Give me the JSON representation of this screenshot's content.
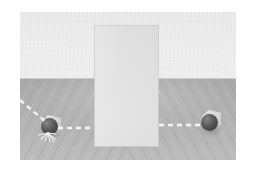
{
  "scene": {
    "title": "Occluded ball trajectory scene",
    "description": "Two dark spheres on a textured gray floor separated by a light rectangular occluder panel, connected by a white dashed trajectory",
    "frame": {
      "x": 20,
      "y": 12,
      "width": 216,
      "height": 148
    },
    "border_color": "#ffffff"
  },
  "background": {
    "label": "back wall",
    "color": "#eeeeee",
    "top_color": "#eaeaea",
    "bottom_color": "#f0f0f0",
    "height": 67
  },
  "horizon": {
    "label": "horizon seam",
    "color": "#c2c2c2",
    "y": 66
  },
  "floor": {
    "label": "wood plank floor",
    "color": "#b0b0b0",
    "near_color": "#bcbcbc",
    "far_color": "#a8a8a8",
    "grain_color": "#969696",
    "highlight_color": "#cdcdcd",
    "left_grain_angle": "118deg",
    "right_grain_angle": "62deg"
  },
  "occluder": {
    "label": "occluder panel",
    "color": "#e0e0e0",
    "edge_color": "#cdcdcd",
    "x": 75,
    "y": 14,
    "width": 63,
    "height": 120
  },
  "objects": [
    {
      "name": "left-ball",
      "label": "Left sphere",
      "color": "#4a4a4a",
      "highlight_color": "#8a8a8a",
      "halo_color": "#d2d2d2",
      "cx": 30,
      "cy": 115,
      "radius": 8.5,
      "state": "impact"
    },
    {
      "name": "right-ball",
      "label": "Right sphere",
      "color": "#4a4a4a",
      "highlight_color": "#8a8a8a",
      "halo_color": "#d2d2d2",
      "cx": 190,
      "cy": 111,
      "radius": 8.5,
      "state": "resting"
    }
  ],
  "trajectory": {
    "label": "dashed motion path",
    "color": "#f5f5f5",
    "dash_length": 5,
    "dash_gap": 4,
    "stroke_width": 2.4,
    "segments": [
      {
        "name": "incoming-diagonal",
        "x1": 0,
        "y1": 88,
        "x2": 26,
        "y2": 110
      },
      {
        "name": "horizontal-left",
        "x1": 38,
        "y1": 116,
        "x2": 74,
        "y2": 116
      },
      {
        "name": "horizontal-right",
        "x1": 139,
        "y1": 113,
        "x2": 180,
        "y2": 113
      }
    ],
    "impact_burst": {
      "name": "impact-burst",
      "cx": 28,
      "cy": 124,
      "ray_count": 7,
      "color": "#f2f2f2"
    }
  }
}
